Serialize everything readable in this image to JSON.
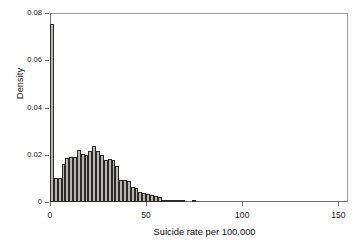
{
  "chart_data": {
    "type": "bar",
    "title": "",
    "subtitle": "",
    "xlabel": "Suicide rate per 100.000",
    "ylabel": "Density",
    "xlim": [
      0,
      155
    ],
    "ylim": [
      0,
      0.08
    ],
    "grid": false,
    "legend": null,
    "bin_width": 2,
    "bar_fill_color": "#b9b6b1",
    "bar_edge_color": "#2b2b2b",
    "axis_color": "#6e6e6e",
    "xticks": [
      0,
      50,
      100,
      150
    ],
    "xticklabels": [
      "0",
      "50",
      "100",
      "150"
    ],
    "yticks": [
      0,
      0.02,
      0.04,
      0.06,
      0.08
    ],
    "yticklabels": [
      "0",
      "0.02",
      "0.04",
      "0.06",
      "0.08"
    ],
    "x": [
      1,
      3,
      5,
      7,
      9,
      11,
      13,
      15,
      17,
      19,
      21,
      23,
      25,
      27,
      29,
      31,
      33,
      35,
      37,
      39,
      41,
      43,
      45,
      47,
      49,
      51,
      53,
      55,
      57,
      59,
      61,
      63,
      65,
      67,
      69,
      75
    ],
    "categories": [
      "0-2",
      "2-4",
      "4-6",
      "6-8",
      "8-10",
      "10-12",
      "12-14",
      "14-16",
      "16-18",
      "18-20",
      "20-22",
      "22-24",
      "24-26",
      "26-28",
      "28-30",
      "30-32",
      "32-34",
      "34-36",
      "36-38",
      "38-40",
      "40-42",
      "42-44",
      "44-46",
      "46-48",
      "48-50",
      "50-52",
      "52-54",
      "54-56",
      "56-58",
      "58-60",
      "60-62",
      "62-64",
      "64-66",
      "66-68",
      "68-70",
      "74-76"
    ],
    "values": [
      0.0755,
      0.01,
      0.01,
      0.016,
      0.0185,
      0.019,
      0.019,
      0.0222,
      0.0205,
      0.02,
      0.0215,
      0.0238,
      0.0215,
      0.02,
      0.0178,
      0.018,
      0.0178,
      0.0152,
      0.0095,
      0.0095,
      0.009,
      0.0063,
      0.006,
      0.0042,
      0.004,
      0.0032,
      0.003,
      0.0025,
      0.0022,
      0.001,
      0.0008,
      0.0008,
      0.0008,
      0.0008,
      0.0008,
      0.0006
    ]
  }
}
